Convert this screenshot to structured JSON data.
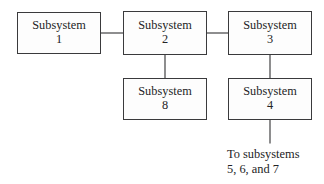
{
  "diagram": {
    "type": "block-diagram",
    "background_color": "#ffffff",
    "line_color": "#3a3a3c",
    "text_color": "#232325",
    "box_fill_color": "#fdfdfd",
    "nodes": [
      {
        "id": "subsystem-1",
        "label_line1": "Subsystem",
        "label_line2": "1",
        "x": 17,
        "y": 12,
        "w": 84,
        "h": 42
      },
      {
        "id": "subsystem-2",
        "label_line1": "Subsystem",
        "label_line2": "2",
        "x": 123,
        "y": 11,
        "w": 84,
        "h": 44
      },
      {
        "id": "subsystem-3",
        "label_line1": "Subsystem",
        "label_line2": "3",
        "x": 228,
        "y": 11,
        "w": 84,
        "h": 44
      },
      {
        "id": "subsystem-8",
        "label_line1": "Subsystem",
        "label_line2": "8",
        "x": 123,
        "y": 78,
        "w": 84,
        "h": 42
      },
      {
        "id": "subsystem-4",
        "label_line1": "Subsystem",
        "label_line2": "4",
        "x": 228,
        "y": 78,
        "w": 84,
        "h": 42
      }
    ],
    "connectors": [
      {
        "id": "connector-1-to-2",
        "from": "subsystem-1",
        "to": "subsystem-2",
        "orientation": "horizontal",
        "x1": 101,
        "y1": 33,
        "x2": 123,
        "y2": 33
      },
      {
        "id": "connector-2-to-3",
        "from": "subsystem-2",
        "to": "subsystem-3",
        "orientation": "horizontal",
        "x1": 207,
        "y1": 33,
        "x2": 228,
        "y2": 33
      },
      {
        "id": "connector-2-to-8",
        "from": "subsystem-2",
        "to": "subsystem-8",
        "orientation": "vertical",
        "x1": 165,
        "y1": 55,
        "x2": 165,
        "y2": 78
      },
      {
        "id": "connector-3-to-4",
        "from": "subsystem-3",
        "to": "subsystem-4",
        "orientation": "vertical",
        "x1": 270,
        "y1": 55,
        "x2": 270,
        "y2": 78
      },
      {
        "id": "connector-4-to-caption",
        "from": "subsystem-4",
        "to": "caption-to-subsystems",
        "orientation": "vertical",
        "x1": 270,
        "y1": 120,
        "x2": 270,
        "y2": 143
      }
    ],
    "caption": {
      "id": "caption-to-subsystems",
      "line1": "To subsystems",
      "line2": "5, 6, and 7",
      "x": 227,
      "y": 147
    }
  }
}
